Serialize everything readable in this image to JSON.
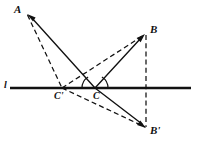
{
  "figure": {
    "type": "geometry-diagram",
    "canvas": {
      "width": 197,
      "height": 150
    },
    "background_color": "#ffffff",
    "stroke_color": "#111111"
  },
  "labels": {
    "A": {
      "text": "A",
      "x": 14,
      "y": 5
    },
    "B": {
      "text": "B",
      "x": 150,
      "y": 25
    },
    "B_prime": {
      "text": "B'",
      "x": 150,
      "y": 125
    },
    "C": {
      "text": "C",
      "x": 93,
      "y": 91
    },
    "C_prime": {
      "text": "C'",
      "x": 54,
      "y": 91
    },
    "l": {
      "text": "l",
      "x": 4,
      "y": 81
    }
  },
  "points": {
    "A": {
      "x": 27,
      "y": 14
    },
    "B": {
      "x": 145,
      "y": 34
    },
    "B_prime": {
      "x": 146,
      "y": 128
    },
    "C": {
      "x": 95,
      "y": 88
    },
    "C_prime": {
      "x": 62,
      "y": 88
    },
    "line_left": {
      "x": 10,
      "y": 88
    },
    "line_right": {
      "x": 191,
      "y": 88
    }
  },
  "segments": [
    {
      "name": "line-l",
      "from": "line_left",
      "to": "line_right",
      "style": "solid",
      "width": 2.2,
      "arrow": "none"
    },
    {
      "name": "ray-C-to-A",
      "from": "C",
      "to": "A",
      "style": "solid",
      "width": 1.3,
      "arrow": "end"
    },
    {
      "name": "ray-C-to-B",
      "from": "C",
      "to": "B",
      "style": "solid",
      "width": 1.3,
      "arrow": "end"
    },
    {
      "name": "ray-C-to-Bp",
      "from": "C",
      "to": "B_prime",
      "style": "solid",
      "width": 1.3,
      "arrow": "end"
    },
    {
      "name": "dash-A-to-Cp",
      "from": "A",
      "to": "C_prime",
      "style": "dashed",
      "width": 1.2,
      "arrow": "none"
    },
    {
      "name": "dash-Cp-to-B",
      "from": "C_prime",
      "to": "B",
      "style": "dashed",
      "width": 1.2,
      "arrow": "none"
    },
    {
      "name": "dash-Cp-to-Bp",
      "from": "C_prime",
      "to": "B_prime",
      "style": "dashed",
      "width": 1.2,
      "arrow": "none"
    },
    {
      "name": "dash-B-to-Bp",
      "from": "B",
      "to": "B_prime",
      "style": "dashed",
      "width": 1.2,
      "arrow": "none"
    }
  ],
  "angle_marks": [
    {
      "name": "angle-arc-left-at-C",
      "vertex": "C",
      "radius": 13,
      "start_deg": 180,
      "end_deg": 122
    },
    {
      "name": "angle-arc-right-at-C",
      "vertex": "C",
      "radius": 13,
      "start_deg": 0,
      "end_deg": 58
    }
  ]
}
